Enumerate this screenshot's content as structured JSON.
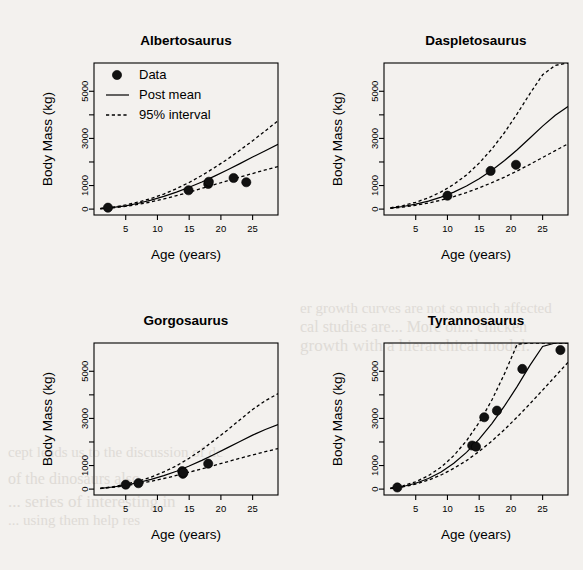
{
  "figure": {
    "layout": "2x2 panel grid",
    "background_note": "scanned book page with faint bleed-through text",
    "shared_xlabel": "Age (years)",
    "shared_ylabel": "Body Mass (kg)",
    "legend": {
      "position": "top-left of first panel",
      "entries": [
        {
          "label": "Data",
          "marker": "filled-circle"
        },
        {
          "label": "Post mean",
          "marker": "solid-line"
        },
        {
          "label": "95% interval",
          "marker": "dashed-line"
        }
      ]
    },
    "ghost_text": [
      {
        "text": "er growth curves are not so much affected",
        "x": 300,
        "y": 300
      },
      {
        "text": "cal studies are...  More on...  chicken",
        "x": 300,
        "y": 318
      },
      {
        "text": "growth    with a hierarchical model.",
        "x": 300,
        "y": 336
      },
      {
        "text": "cept leads us to the discussion of dc",
        "x": 8,
        "y": 444
      },
      {
        "text": "of the dinosaurs also",
        "x": 8,
        "y": 470
      },
      {
        "text": "...   series of interesting in",
        "x": 8,
        "y": 492
      },
      {
        "text": "...  using them help res",
        "x": 8,
        "y": 512
      }
    ]
  },
  "chart_data": [
    {
      "type": "scatter",
      "title": "Albertosaurus",
      "xlabel": "Age (years)",
      "ylabel": "Body Mass (kg)",
      "xlim": [
        0,
        29
      ],
      "ylim": [
        -250,
        6200
      ],
      "xticks": [
        5,
        10,
        15,
        20,
        25
      ],
      "yticks": [
        0,
        1000,
        3000,
        5000
      ],
      "yminorticks": [
        2000,
        4000
      ],
      "grid": false,
      "points": [
        {
          "x": 2.2,
          "y": 60
        },
        {
          "x": 14.9,
          "y": 800
        },
        {
          "x": 18.0,
          "y": 1070
        },
        {
          "x": 18.1,
          "y": 1160
        },
        {
          "x": 22.0,
          "y": 1320
        },
        {
          "x": 24.0,
          "y": 1140
        }
      ],
      "series": [
        {
          "name": "Post mean",
          "style": "solid",
          "x": [
            1,
            3,
            5,
            7,
            9,
            11,
            13,
            15,
            17,
            19,
            21,
            23,
            25,
            27,
            29
          ],
          "y": [
            20,
            70,
            140,
            250,
            380,
            540,
            720,
            930,
            1150,
            1400,
            1660,
            1930,
            2210,
            2480,
            2750
          ]
        },
        {
          "name": "95% interval upper",
          "style": "dashed",
          "x": [
            1,
            3,
            5,
            7,
            9,
            11,
            13,
            15,
            17,
            19,
            21,
            23,
            25,
            27,
            29
          ],
          "y": [
            25,
            85,
            175,
            300,
            450,
            640,
            870,
            1130,
            1430,
            1760,
            2110,
            2500,
            2900,
            3320,
            3750
          ]
        },
        {
          "name": "95% interval lower",
          "style": "dashed",
          "x": [
            1,
            3,
            5,
            7,
            9,
            11,
            13,
            15,
            17,
            19,
            21,
            23,
            25,
            27,
            29
          ],
          "y": [
            15,
            55,
            115,
            200,
            305,
            430,
            570,
            720,
            880,
            1040,
            1200,
            1360,
            1510,
            1660,
            1800
          ]
        }
      ]
    },
    {
      "type": "scatter",
      "title": "Daspletosaurus",
      "xlabel": "Age (years)",
      "ylabel": "Body Mass (kg)",
      "xlim": [
        0,
        29
      ],
      "ylim": [
        -250,
        6200
      ],
      "xticks": [
        5,
        10,
        15,
        20,
        25
      ],
      "yticks": [
        0,
        1000,
        3000,
        5000
      ],
      "yminorticks": [
        2000,
        4000
      ],
      "grid": false,
      "points": [
        {
          "x": 10.0,
          "y": 570
        },
        {
          "x": 16.8,
          "y": 1620
        },
        {
          "x": 20.8,
          "y": 1880
        }
      ],
      "series": [
        {
          "name": "Post mean",
          "style": "solid",
          "x": [
            1,
            3,
            5,
            7,
            9,
            11,
            13,
            15,
            17,
            19,
            21,
            23,
            25,
            27,
            29
          ],
          "y": [
            40,
            110,
            210,
            340,
            510,
            720,
            980,
            1290,
            1650,
            2060,
            2520,
            3020,
            3520,
            3980,
            4350
          ]
        },
        {
          "name": "95% interval upper",
          "style": "dashed",
          "x": [
            1,
            3,
            5,
            7,
            9,
            11,
            13,
            15,
            17,
            19,
            21,
            23,
            25,
            27,
            29
          ],
          "y": [
            55,
            150,
            290,
            480,
            730,
            1050,
            1450,
            1950,
            2550,
            3250,
            4050,
            4900,
            5700,
            6100,
            6200
          ]
        },
        {
          "name": "95% interval lower",
          "style": "dashed",
          "x": [
            1,
            3,
            5,
            7,
            9,
            11,
            13,
            15,
            17,
            19,
            21,
            23,
            25,
            27,
            29
          ],
          "y": [
            30,
            85,
            160,
            260,
            380,
            530,
            700,
            900,
            1120,
            1360,
            1620,
            1900,
            2190,
            2480,
            2770
          ]
        }
      ]
    },
    {
      "type": "scatter",
      "title": "Gorgosaurus",
      "xlabel": "Age (years)",
      "ylabel": "Body Mass (kg)",
      "xlim": [
        0,
        29
      ],
      "ylim": [
        -250,
        6200
      ],
      "xticks": [
        5,
        10,
        15,
        20,
        25
      ],
      "yticks": [
        0,
        1000,
        3000,
        5000
      ],
      "yminorticks": [
        2000,
        4000
      ],
      "grid": false,
      "points": [
        {
          "x": 5.0,
          "y": 190
        },
        {
          "x": 7.0,
          "y": 250
        },
        {
          "x": 13.9,
          "y": 760
        },
        {
          "x": 14.0,
          "y": 650
        },
        {
          "x": 14.1,
          "y": 700
        },
        {
          "x": 18.0,
          "y": 1080
        }
      ],
      "series": [
        {
          "name": "Post mean",
          "style": "solid",
          "x": [
            1,
            3,
            5,
            7,
            9,
            11,
            13,
            15,
            17,
            19,
            21,
            23,
            25,
            27,
            29
          ],
          "y": [
            30,
            90,
            170,
            280,
            410,
            570,
            760,
            980,
            1220,
            1480,
            1750,
            2020,
            2290,
            2530,
            2740
          ]
        },
        {
          "name": "95% interval upper",
          "style": "dashed",
          "x": [
            1,
            3,
            5,
            7,
            9,
            11,
            13,
            15,
            17,
            19,
            21,
            23,
            25,
            27,
            29
          ],
          "y": [
            35,
            105,
            205,
            340,
            510,
            730,
            990,
            1310,
            1670,
            2080,
            2500,
            2940,
            3380,
            3750,
            4050
          ]
        },
        {
          "name": "95% interval lower",
          "style": "dashed",
          "x": [
            1,
            3,
            5,
            7,
            9,
            11,
            13,
            15,
            17,
            19,
            21,
            23,
            25,
            27,
            29
          ],
          "y": [
            25,
            75,
            145,
            230,
            330,
            450,
            580,
            720,
            860,
            1010,
            1160,
            1310,
            1450,
            1590,
            1720
          ]
        }
      ]
    },
    {
      "type": "scatter",
      "title": "Tyrannosaurus",
      "xlabel": "Age (years)",
      "ylabel": "Body Mass (kg)",
      "xlim": [
        0,
        29
      ],
      "ylim": [
        -250,
        6200
      ],
      "xticks": [
        5,
        10,
        15,
        20,
        25
      ],
      "yticks": [
        0,
        1000,
        3000,
        5000
      ],
      "yminorticks": [
        2000,
        4000
      ],
      "grid": false,
      "points": [
        {
          "x": 2.1,
          "y": 70
        },
        {
          "x": 13.9,
          "y": 1850
        },
        {
          "x": 14.5,
          "y": 1800
        },
        {
          "x": 15.8,
          "y": 3050
        },
        {
          "x": 17.8,
          "y": 3330
        },
        {
          "x": 21.8,
          "y": 5100
        },
        {
          "x": 27.8,
          "y": 5900
        }
      ],
      "series": [
        {
          "name": "Post mean",
          "style": "solid",
          "x": [
            1,
            3,
            5,
            7,
            9,
            11,
            13,
            15,
            17,
            19,
            21,
            23,
            25,
            27,
            29
          ],
          "y": [
            30,
            110,
            250,
            450,
            730,
            1100,
            1560,
            2120,
            2780,
            3530,
            4360,
            5250,
            6050,
            6200,
            6200
          ]
        },
        {
          "name": "95% interval upper",
          "style": "dashed",
          "x": [
            1,
            3,
            5,
            7,
            9,
            11,
            13,
            15,
            17,
            19,
            21,
            23,
            25,
            27,
            29
          ],
          "y": [
            40,
            140,
            310,
            570,
            930,
            1420,
            2050,
            2830,
            3780,
            4900,
            6150,
            6200,
            6200,
            6200,
            6200
          ]
        },
        {
          "name": "95% interval lower",
          "style": "dashed",
          "x": [
            1,
            3,
            5,
            7,
            9,
            11,
            13,
            15,
            17,
            19,
            21,
            23,
            25,
            27,
            29
          ],
          "y": [
            25,
            95,
            210,
            380,
            600,
            880,
            1210,
            1600,
            2040,
            2530,
            3060,
            3620,
            4200,
            4790,
            5380
          ]
        }
      ]
    }
  ]
}
